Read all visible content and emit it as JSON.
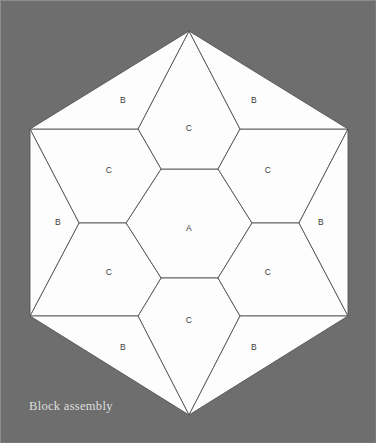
{
  "figure": {
    "caption": "Block assembly",
    "background_color": "#6e6e6e",
    "piece_fill_color": "#fdfdfd",
    "piece_stroke_color": "#555555",
    "label_color": "#3a3a3a",
    "caption_color": "#dedede",
    "outline_shape": "hexagon",
    "outline_vertices": [
      [
        188,
        30
      ],
      [
        347,
        128
      ],
      [
        347,
        315
      ],
      [
        188,
        414
      ],
      [
        29,
        315
      ],
      [
        29,
        128
      ]
    ]
  },
  "pieces": [
    {
      "id": "center-a",
      "label": "A",
      "label_x": 188,
      "label_y": 228,
      "points": "160,168 217,168 251,222 217,277 160,277 125,222"
    },
    {
      "id": "top-c",
      "label": "C",
      "label_x": 188,
      "label_y": 128,
      "points": "188,30 239,128 217,168 160,168 137,128"
    },
    {
      "id": "bottom-c",
      "label": "C",
      "label_x": 188,
      "label_y": 320,
      "points": "160,277 217,277 239,315 188,414 137,315"
    },
    {
      "id": "upper-left-c",
      "label": "C",
      "label_x": 108,
      "label_y": 170,
      "points": "29,128 137,128 160,168 125,222 78,222"
    },
    {
      "id": "upper-right-c",
      "label": "C",
      "label_x": 267,
      "label_y": 170,
      "points": "239,128 347,128 298,222 251,222 217,168"
    },
    {
      "id": "lower-left-c",
      "label": "C",
      "label_x": 108,
      "label_y": 272,
      "points": "78,222 125,222 160,277 137,315 29,315"
    },
    {
      "id": "lower-right-c",
      "label": "C",
      "label_x": 267,
      "label_y": 272,
      "points": "251,222 298,222 347,315 239,315 217,277"
    },
    {
      "id": "top-left-b",
      "label": "B",
      "label_x": 122,
      "label_y": 100,
      "points": "188,30 137,128 29,128"
    },
    {
      "id": "top-right-b",
      "label": "B",
      "label_x": 253,
      "label_y": 100,
      "points": "188,30 347,128 239,128"
    },
    {
      "id": "left-b",
      "label": "B",
      "label_x": 57,
      "label_y": 222,
      "points": "29,128 78,222 29,315"
    },
    {
      "id": "right-b",
      "label": "B",
      "label_x": 320,
      "label_y": 222,
      "points": "347,128 347,315 298,222"
    },
    {
      "id": "bottom-left-b",
      "label": "B",
      "label_x": 122,
      "label_y": 347,
      "points": "29,315 137,315 188,414"
    },
    {
      "id": "bottom-right-b",
      "label": "B",
      "label_x": 253,
      "label_y": 347,
      "points": "239,315 347,315 188,414"
    }
  ]
}
